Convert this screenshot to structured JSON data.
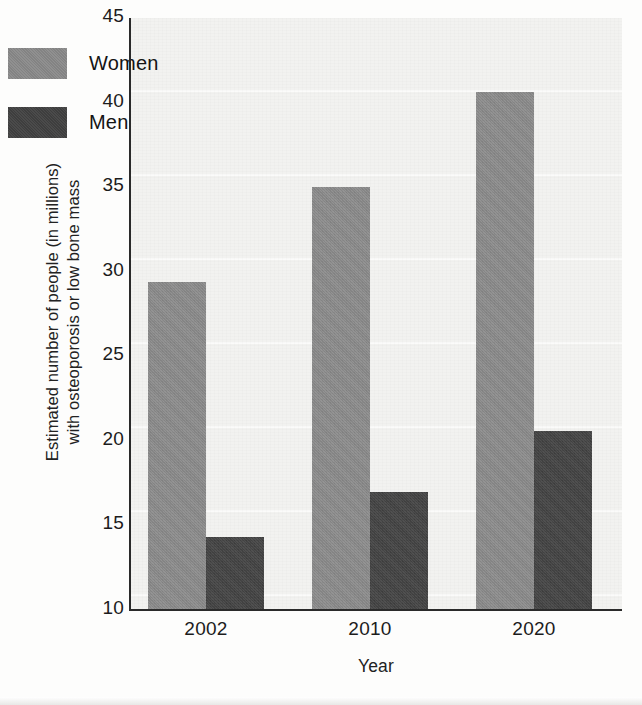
{
  "chart_data": {
    "type": "bar",
    "title": "",
    "subtitle": "",
    "xlabel": "Year",
    "ylabel": "Estimated number of people (in millions) with osteoporosis or low bone mass",
    "ylabel_line1": "Estimated number of people (in millions)",
    "ylabel_line2": "with osteoporosis or low bone mass",
    "categories": [
      "2002",
      "2010",
      "2020"
    ],
    "series": [
      {
        "name": "Women",
        "values": [
          29.4,
          35.0,
          40.6
        ],
        "color": "#8a8a8a"
      },
      {
        "name": "Men",
        "values": [
          14.3,
          17.0,
          20.6
        ],
        "color": "#414141"
      }
    ],
    "ylim": [
      10,
      45
    ],
    "ytick_values": [
      45,
      40,
      35,
      30,
      25,
      20,
      15,
      10
    ],
    "ytick_labels": [
      "45",
      "40",
      "35",
      "30",
      "25",
      "20",
      "15",
      "10"
    ],
    "grid": false,
    "legend_position": "upper-left-inside",
    "plot_background": "#f2f2f0"
  },
  "legend": {
    "entries": [
      {
        "label": "Women",
        "swatch_color": "#8a8a8a"
      },
      {
        "label": "Men",
        "swatch_color": "#414141"
      }
    ]
  },
  "axes": {
    "y_title_line1": "Estimated number of people (in millions)",
    "y_title_line2": "with osteoporosis or low bone mass",
    "x_title": "Year",
    "y_ticks": [
      "45",
      "40",
      "35",
      "30",
      "25",
      "20",
      "15",
      "10"
    ],
    "x_ticks": [
      "2002",
      "2010",
      "2020"
    ]
  }
}
